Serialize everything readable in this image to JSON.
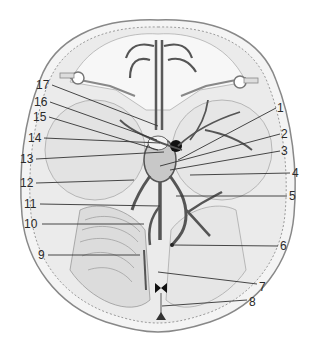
{
  "figure": {
    "labels": [
      {
        "id": "1",
        "text": "1",
        "x": 277,
        "y": 102,
        "lx1": 276,
        "ly1": 108,
        "lx2": 178,
        "ly2": 160
      },
      {
        "id": "2",
        "text": "2",
        "x": 281,
        "y": 128,
        "lx1": 280,
        "ly1": 134,
        "lx2": 160,
        "ly2": 166
      },
      {
        "id": "3",
        "text": "3",
        "x": 281,
        "y": 145,
        "lx1": 280,
        "ly1": 151,
        "lx2": 170,
        "ly2": 170
      },
      {
        "id": "4",
        "text": "4",
        "x": 292,
        "y": 167,
        "lx1": 290,
        "ly1": 173,
        "lx2": 190,
        "ly2": 175
      },
      {
        "id": "5",
        "text": "5",
        "x": 289,
        "y": 190,
        "lx1": 287,
        "ly1": 196,
        "lx2": 176,
        "ly2": 196
      },
      {
        "id": "6",
        "text": "6",
        "x": 280,
        "y": 240,
        "lx1": 278,
        "ly1": 246,
        "lx2": 172,
        "ly2": 245
      },
      {
        "id": "7",
        "text": "7",
        "x": 259,
        "y": 281,
        "lx1": 257,
        "ly1": 284,
        "lx2": 158,
        "ly2": 272
      },
      {
        "id": "8",
        "text": "8",
        "x": 249,
        "y": 296,
        "lx1": 247,
        "ly1": 300,
        "lx2": 162,
        "ly2": 306
      },
      {
        "id": "9",
        "text": "9",
        "x": 38,
        "y": 249,
        "lx1": 48,
        "ly1": 255,
        "lx2": 140,
        "ly2": 255
      },
      {
        "id": "10",
        "text": "10",
        "x": 24,
        "y": 218,
        "lx1": 42,
        "ly1": 224,
        "lx2": 144,
        "ly2": 224
      },
      {
        "id": "11",
        "text": "11",
        "x": 24,
        "y": 198,
        "lx1": 40,
        "ly1": 204,
        "lx2": 160,
        "ly2": 206
      },
      {
        "id": "12",
        "text": "12",
        "x": 20,
        "y": 177,
        "lx1": 36,
        "ly1": 183,
        "lx2": 134,
        "ly2": 180
      },
      {
        "id": "13",
        "text": "13",
        "x": 20,
        "y": 153,
        "lx1": 36,
        "ly1": 159,
        "lx2": 164,
        "ly2": 152
      },
      {
        "id": "14",
        "text": "14",
        "x": 28,
        "y": 132,
        "lx1": 44,
        "ly1": 138,
        "lx2": 160,
        "ly2": 143
      },
      {
        "id": "15",
        "text": "15",
        "x": 33,
        "y": 111,
        "lx1": 49,
        "ly1": 117,
        "lx2": 158,
        "ly2": 150
      },
      {
        "id": "16",
        "text": "16",
        "x": 34,
        "y": 96,
        "lx1": 50,
        "ly1": 102,
        "lx2": 157,
        "ly2": 140
      },
      {
        "id": "17",
        "text": "17",
        "x": 36,
        "y": 79,
        "lx1": 52,
        "ly1": 85,
        "lx2": 158,
        "ly2": 126
      }
    ]
  },
  "colors": {
    "background": "#ffffff",
    "bone_outline": "#8a8a8a",
    "bone_fill": "#efefef",
    "shade": "#d8d8d8",
    "sinus": "#5a5a5a",
    "dark_sinus": "#1a1a1a",
    "leader": "#333333",
    "label": "#2a2a2a"
  }
}
